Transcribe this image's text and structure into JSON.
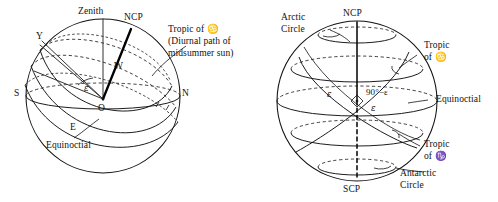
{
  "figure": {
    "panels": [
      {
        "id": "left-panel",
        "name": "celestial-sphere-observer-diagram",
        "labels": {
          "zenith": "Zenith",
          "ncp": "NCP",
          "tropic_of_cancer": "Tropic of ♋",
          "tropic_caption_line1": "(Diurnal path of",
          "tropic_caption_line2": "midsummer sun)",
          "point_y": "Y",
          "point_w": "W",
          "point_s": "S",
          "point_n": "N",
          "point_o": "O",
          "point_e_horizon": "E",
          "angle_epsilon": "ε",
          "equinoctial": "Equinoctial"
        }
      },
      {
        "id": "right-panel",
        "name": "celestial-sphere-tropics-diagram",
        "labels": {
          "arctic_circle_line1": "Arctic",
          "arctic_circle_line2": "Circle",
          "ncp": "NCP",
          "tropic_cancer_line1": "Tropic",
          "tropic_cancer_line2": "of ♋",
          "equinoctial": "Equinoctial",
          "tropic_capricorn_line1": "Tropic",
          "tropic_capricorn_line2": "of ♑",
          "antarctic_circle_line1": "Antarctic",
          "antarctic_circle_line2": "Circle",
          "scp": "SCP",
          "angle_epsilon_left": "ε",
          "angle_ninety_minus_epsilon": "90°−ε",
          "angle_epsilon_lower": "ε"
        }
      }
    ],
    "colors": {
      "ink": "#111111",
      "background": "#ffffff"
    }
  }
}
